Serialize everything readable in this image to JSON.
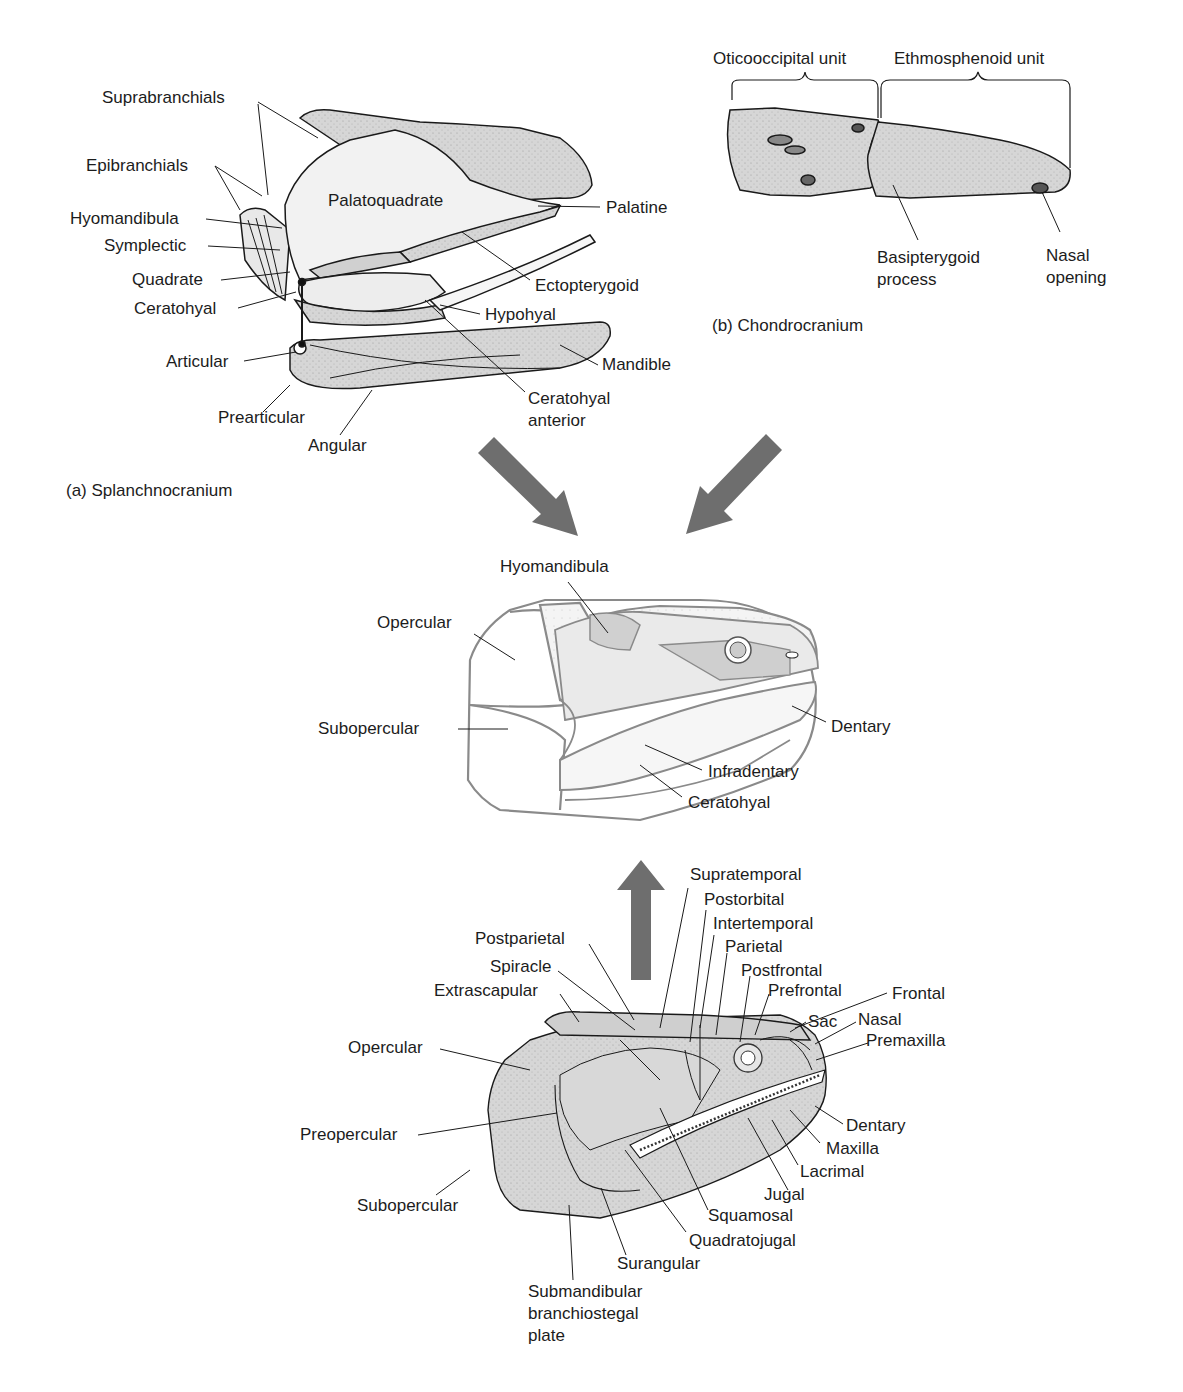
{
  "figure": {
    "panels": {
      "a": {
        "caption": "(a) Splanchnocranium",
        "labels": {
          "suprabranchials": "Suprabranchials",
          "epibranchials": "Epibranchials",
          "hyomandibula": "Hyomandibula",
          "symplectic": "Symplectic",
          "quadrate": "Quadrate",
          "ceratohyal": "Ceratohyal",
          "articular": "Articular",
          "prearticular": "Prearticular",
          "angular": "Angular",
          "palatoquadrate": "Palatoquadrate",
          "palatine": "Palatine",
          "ectopterygoid": "Ectopterygoid",
          "hypohyal": "Hypohyal",
          "mandible": "Mandible",
          "ceratohyal_anterior": "Ceratohyal\nanterior"
        }
      },
      "b": {
        "caption": "(b) Chondrocranium",
        "labels": {
          "oticooccipital_unit": "Oticooccipital unit",
          "ethmosphenoid_unit": "Ethmosphenoid unit",
          "basipterygoid_process": "Basipterygoid\nprocess",
          "nasal_opening": "Nasal\nopening"
        }
      },
      "composite": {
        "labels": {
          "hyomandibula": "Hyomandibula",
          "opercular": "Opercular",
          "subopercular": "Subopercular",
          "dentary": "Dentary",
          "infradentary": "Infradentary",
          "ceratohyal": "Ceratohyal"
        }
      },
      "dermatocranium": {
        "labels": {
          "supratemporal": "Supratemporal",
          "postorbital": "Postorbital",
          "intertemporal": "Intertemporal",
          "parietal": "Parietal",
          "postparietal": "Postparietal",
          "spiracle": "Spiracle",
          "extrascapular": "Extrascapular",
          "postfrontal": "Postfrontal",
          "prefrontal": "Prefrontal",
          "frontal": "Frontal",
          "sac": "Sac",
          "nasal": "Nasal",
          "premaxilla": "Premaxilla",
          "opercular": "Opercular",
          "preopercular": "Preopercular",
          "subopercular": "Subopercular",
          "dentary": "Dentary",
          "maxilla": "Maxilla",
          "lacrimal": "Lacrimal",
          "jugal": "Jugal",
          "squamosal": "Squamosal",
          "quadratojugal": "Quadratojugal",
          "surangular": "Surangular",
          "submandibular_branchiostegal_plate": "Submandibular\nbranchiostegal\nplate"
        }
      }
    },
    "colors": {
      "bone_fill": "#d4d4d4",
      "light_fill": "#ececec",
      "outline": "#1a1a1a",
      "gray_outline": "#8a8a8a",
      "arrow": "#6e6e6e"
    }
  }
}
